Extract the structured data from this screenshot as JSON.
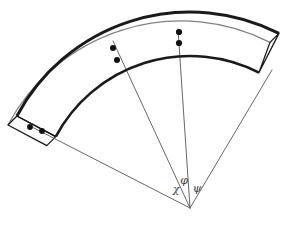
{
  "figure": {
    "type": "geometry-diagram",
    "width": 291,
    "height": 228,
    "background_color": "#ffffff"
  },
  "colors": {
    "stroke_heavy": "#1a1a1a",
    "stroke_thin": "#555555",
    "dot_fill": "#111111",
    "band_fill": "#ffffff",
    "cap_fill": "#fbfbfb",
    "label_color": "#3a3a3a"
  },
  "geometry": {
    "apex": {
      "x": 190,
      "y": 208
    },
    "radius_outer": 196,
    "radius_inner": 152,
    "angle_start_deg": 208,
    "angle_end_deg": 297,
    "depth_offset": {
      "dx": -9,
      "dy": 9
    }
  },
  "labels": [
    {
      "id": "chi",
      "text": "χ",
      "x": 176,
      "y": 190,
      "font_size": 11
    },
    {
      "id": "phi",
      "text": "φ",
      "x": 184,
      "y": 181,
      "font_size": 11
    },
    {
      "id": "psi",
      "text": "ψ",
      "x": 197,
      "y": 189,
      "font_size": 11
    }
  ],
  "rays": [
    {
      "id": "ray-chi",
      "label": "χ",
      "from": {
        "x": 190,
        "y": 208
      },
      "to": {
        "x": 28,
        "y": 125
      },
      "stroke_width": 0.9
    },
    {
      "id": "ray-phi",
      "label": "φ",
      "from": {
        "x": 190,
        "y": 208
      },
      "to": {
        "x": 113,
        "y": 41
      },
      "stroke_width": 0.9
    },
    {
      "id": "ray-psi",
      "label": "ψ",
      "from": {
        "x": 190,
        "y": 208
      },
      "to": {
        "x": 178,
        "y": 29
      },
      "stroke_width": 0.9
    },
    {
      "id": "ray-edge-right",
      "label": "",
      "from": {
        "x": 190,
        "y": 208
      },
      "to": {
        "x": 272,
        "y": 70
      },
      "stroke_width": 0.9
    }
  ],
  "markers": [
    {
      "id": "dot-psi-outer",
      "x": 179,
      "y": 32,
      "r": 3.1
    },
    {
      "id": "dot-psi-inner",
      "x": 179,
      "y": 43,
      "r": 3.1
    },
    {
      "id": "dot-phi-outer",
      "x": 113,
      "y": 48,
      "r": 3.0
    },
    {
      "id": "dot-phi-inner",
      "x": 117,
      "y": 60,
      "r": 3.0
    },
    {
      "id": "dot-cap-left-a",
      "x": 30,
      "y": 127,
      "r": 2.9
    },
    {
      "id": "dot-cap-left-b",
      "x": 42,
      "y": 131,
      "r": 2.9
    }
  ],
  "strokes": {
    "arc_outer_width": 3.0,
    "arc_inner_width": 2.6,
    "cap_width": 1.3,
    "depth_edge_width": 1.2
  }
}
